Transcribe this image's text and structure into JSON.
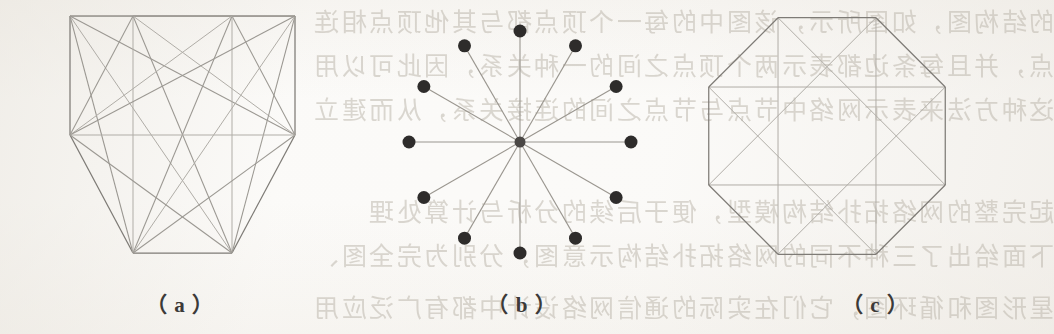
{
  "page": {
    "kind": "scanned-book-figure",
    "width": 1054,
    "height": 334,
    "paper_color": "#fbfaf8",
    "ink_color": "#7e7b76",
    "node_color": "#2e2c2b",
    "bleed_text_color": "#b9b3a8"
  },
  "figure": {
    "panels": [
      {
        "id": "a",
        "caption": "（ a ）"
      },
      {
        "id": "b",
        "caption": "（ b ）"
      },
      {
        "id": "c",
        "caption": "（ c ）"
      }
    ]
  },
  "bleed_through": {
    "note": "faint mirrored show-through text from the reverse side of the page",
    "lines": [
      "的结构图，如图所示，该图中的每一个顶点都与其他顶点相连",
      "点，并且每条边都表示两个顶点之间的一种关系，因此可以用",
      "这种方法来表示网络中节点与节点之间的连接关系，从而建立",
      "起完整的网络拓扑结构模型，便于后续的分析与计算处理",
      "下面给出了三种不同的网络拓扑结构示意图，分别为完全图、",
      "星形图和循环图，它们在实际的通信网络设计中都有广泛应用"
    ]
  },
  "chart_data": [
    {
      "type": "graph",
      "panel": "a",
      "title": "Complete graph on 8 vertices (octagon with all chords)",
      "layout": "octagon",
      "vertex_count": 8,
      "center": [
        182,
        134
      ],
      "vertices": [
        [
          70,
          16
        ],
        [
          133,
          16
        ],
        [
          232,
          16
        ],
        [
          295,
          16
        ],
        [
          295,
          135
        ],
        [
          232,
          253
        ],
        [
          133,
          253
        ],
        [
          70,
          135
        ]
      ],
      "edges": [
        [
          0,
          1
        ],
        [
          1,
          2
        ],
        [
          2,
          3
        ],
        [
          3,
          4
        ],
        [
          4,
          5
        ],
        [
          5,
          6
        ],
        [
          6,
          7
        ],
        [
          7,
          0
        ],
        [
          0,
          2
        ],
        [
          0,
          3
        ],
        [
          0,
          4
        ],
        [
          0,
          5
        ],
        [
          0,
          6
        ],
        [
          1,
          3
        ],
        [
          1,
          4
        ],
        [
          1,
          5
        ],
        [
          1,
          6
        ],
        [
          1,
          7
        ],
        [
          2,
          4
        ],
        [
          2,
          5
        ],
        [
          2,
          6
        ],
        [
          2,
          7
        ],
        [
          3,
          5
        ],
        [
          3,
          6
        ],
        [
          3,
          7
        ],
        [
          4,
          6
        ],
        [
          4,
          7
        ],
        [
          5,
          7
        ]
      ],
      "show_nodes": false
    },
    {
      "type": "graph",
      "panel": "b",
      "title": "Star graph: central hub with 12 leaves",
      "layout": "radial",
      "vertex_count": 13,
      "center": [
        173,
        142
      ],
      "radius": 111,
      "leaf_count": 12,
      "angle_step_deg": 30,
      "start_angle_deg": -90,
      "node_radius": 6.5,
      "hub_radius": 5.5,
      "show_nodes": true
    },
    {
      "type": "graph",
      "panel": "c",
      "title": "Octagon with inscribed star polygon {8/3}",
      "layout": "octagon",
      "vertex_count": 8,
      "center": [
        130,
        136
      ],
      "radius": 128,
      "start_angle_deg": -112.5,
      "perimeter_edges": [
        [
          0,
          1
        ],
        [
          1,
          2
        ],
        [
          2,
          3
        ],
        [
          3,
          4
        ],
        [
          4,
          5
        ],
        [
          5,
          6
        ],
        [
          6,
          7
        ],
        [
          7,
          0
        ]
      ],
      "star_edges": [
        [
          0,
          3
        ],
        [
          3,
          6
        ],
        [
          6,
          1
        ],
        [
          1,
          4
        ],
        [
          4,
          7
        ],
        [
          7,
          2
        ],
        [
          2,
          5
        ],
        [
          5,
          0
        ]
      ],
      "show_nodes": false
    }
  ]
}
